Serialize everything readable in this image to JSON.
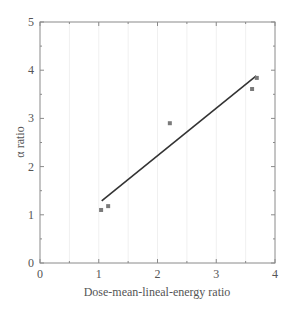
{
  "chart_data": {
    "type": "scatter",
    "title": "",
    "xlabel": "Dose-mean-lineal-energy ratio",
    "ylabel": "α ratio",
    "xlim": [
      0,
      4
    ],
    "ylim": [
      0,
      5
    ],
    "xticks": [
      0,
      1,
      2,
      3,
      4
    ],
    "yticks": [
      0,
      1,
      2,
      3,
      4,
      5
    ],
    "grid": true,
    "legend": null,
    "series": [
      {
        "name": "data",
        "type": "scatter",
        "x": [
          1.04,
          1.16,
          2.21,
          3.61,
          3.69
        ],
        "y": [
          1.1,
          1.18,
          2.9,
          3.61,
          3.84
        ]
      },
      {
        "name": "linear fit",
        "type": "line",
        "x": [
          1.05,
          3.68
        ],
        "y": [
          1.29,
          3.88
        ]
      }
    ],
    "colors": {
      "axis": "#8a8a8a",
      "points": "#7a7a7a",
      "fit_line": "#333333",
      "grid": "#f0f0f0"
    }
  }
}
